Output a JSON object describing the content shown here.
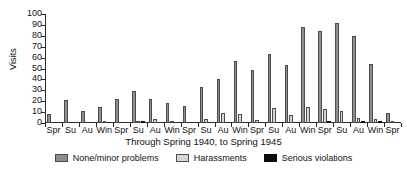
{
  "chart_data": {
    "type": "bar",
    "title": "",
    "xlabel": "Through Spring 1940, to Spring 1945",
    "ylabel": "Visits",
    "ylim": [
      0,
      100
    ],
    "yticks": [
      0,
      10,
      20,
      30,
      40,
      50,
      60,
      70,
      80,
      90,
      100
    ],
    "grid": false,
    "legend_position": "bottom",
    "categories": [
      "Spr",
      "Su",
      "Au",
      "Win",
      "Spr",
      "Su",
      "Au",
      "Win",
      "Spr",
      "Su",
      "Au",
      "Win",
      "Spr",
      "Su",
      "Au",
      "Win",
      "Spr",
      "Su",
      "Au",
      "Win",
      "Spr"
    ],
    "series": [
      {
        "name": "None/minor problems",
        "color": "#8e8e8e",
        "values": [
          8,
          21,
          11,
          15,
          22,
          29,
          22,
          18,
          16,
          33,
          40,
          57,
          49,
          63,
          53,
          88,
          84,
          92,
          80,
          54,
          9
        ]
      },
      {
        "name": "Harassments",
        "color": "#d6d6d6",
        "values": [
          0,
          0,
          0,
          1,
          0,
          2,
          4,
          1,
          0,
          4,
          9,
          8,
          3,
          14,
          7,
          15,
          13,
          11,
          5,
          4,
          1
        ]
      },
      {
        "name": "Serious violations",
        "color": "#0d0d0d",
        "values": [
          0,
          0,
          0,
          0,
          0,
          2,
          0,
          0,
          0,
          0,
          0,
          0,
          0,
          0,
          0,
          0,
          2,
          0,
          2,
          2,
          0
        ]
      }
    ]
  },
  "legend": {
    "items": [
      {
        "label": "None/minor problems",
        "key": "s0"
      },
      {
        "label": "Harassments",
        "key": "s1"
      },
      {
        "label": "Serious violations",
        "key": "s2"
      }
    ]
  }
}
